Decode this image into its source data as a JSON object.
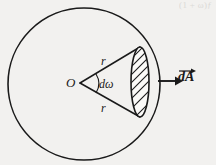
{
  "figure": {
    "background_color": "#f2f1ef",
    "ink_color": "#1a1a1a",
    "labels": {
      "center": "O",
      "radius_top": "r",
      "radius_bottom": "r",
      "solid_angle": "dω",
      "area_vector": "dA"
    },
    "ghost_text": {
      "top_right": "(1 + ω)ƒ",
      "top_middle": ""
    },
    "geometry": {
      "circle": {
        "cx": 84,
        "cy": 84,
        "r": 76
      },
      "apex": {
        "x": 80,
        "y": 83
      },
      "cap_center": {
        "x": 140,
        "y": 82
      },
      "cap_rx": 9,
      "cap_ry": 35,
      "cone_top_point": {
        "x": 140,
        "y": 47
      },
      "cone_bottom_point": {
        "x": 140,
        "y": 117
      },
      "arrow_start": {
        "x": 158,
        "y": 81
      },
      "arrow_end": {
        "x": 178,
        "y": 81
      },
      "hatch_angle_deg": 60,
      "hatch_count": 11
    }
  }
}
